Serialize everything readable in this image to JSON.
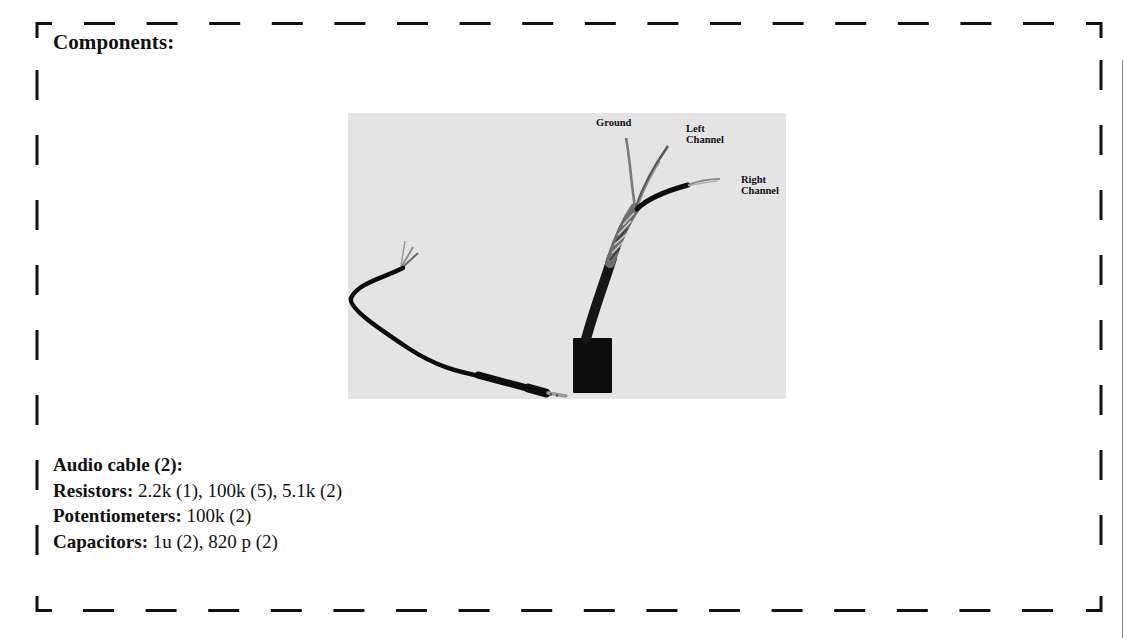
{
  "section": {
    "heading": "Components:"
  },
  "figure": {
    "background_color": "#e4e4e4",
    "wire_labels": [
      {
        "id": "ground",
        "text": "Ground"
      },
      {
        "id": "left",
        "text": "Left\nChannel"
      },
      {
        "id": "right",
        "text": "Right\nChannel"
      }
    ]
  },
  "components": [
    {
      "label": "Audio cable (2):",
      "value": ""
    },
    {
      "label": "Resistors:",
      "value": " 2.2k (1), 100k (5), 5.1k (2)"
    },
    {
      "label": "Potentiometers:",
      "value": " 100k (2)"
    },
    {
      "label": "Capacitors:",
      "value": " 1u (2), 820 p (2)"
    }
  ],
  "colors": {
    "border": "#111111",
    "text": "#111111",
    "photo_bg": "#e4e4e4"
  }
}
